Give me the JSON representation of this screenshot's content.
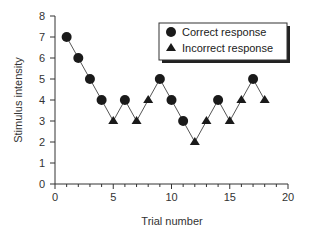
{
  "chart_data": {
    "type": "line",
    "title": "",
    "xlabel": "Trial number",
    "ylabel": "Stimulus intensity",
    "xlim": [
      0,
      20
    ],
    "ylim": [
      0,
      8
    ],
    "x_ticks": [
      0,
      5,
      10,
      15,
      20
    ],
    "x_minor_ticks_step": 1,
    "y_ticks": [
      0,
      1,
      2,
      3,
      4,
      5,
      6,
      7,
      8
    ],
    "grid": false,
    "legend_position": "upper right",
    "legend": [
      {
        "label": "Correct response",
        "marker": "circle"
      },
      {
        "label": "Incorrect response",
        "marker": "triangle"
      }
    ],
    "line_color": "#555555",
    "marker_color": "#1a1a1a",
    "points": [
      {
        "trial": 1,
        "intensity": 7,
        "response": "correct"
      },
      {
        "trial": 2,
        "intensity": 6,
        "response": "correct"
      },
      {
        "trial": 3,
        "intensity": 5,
        "response": "correct"
      },
      {
        "trial": 4,
        "intensity": 4,
        "response": "correct"
      },
      {
        "trial": 5,
        "intensity": 3,
        "response": "incorrect"
      },
      {
        "trial": 6,
        "intensity": 4,
        "response": "correct"
      },
      {
        "trial": 7,
        "intensity": 3,
        "response": "incorrect"
      },
      {
        "trial": 8,
        "intensity": 4,
        "response": "incorrect"
      },
      {
        "trial": 9,
        "intensity": 5,
        "response": "correct"
      },
      {
        "trial": 10,
        "intensity": 4,
        "response": "correct"
      },
      {
        "trial": 11,
        "intensity": 3,
        "response": "correct"
      },
      {
        "trial": 12,
        "intensity": 2,
        "response": "incorrect"
      },
      {
        "trial": 13,
        "intensity": 3,
        "response": "incorrect"
      },
      {
        "trial": 14,
        "intensity": 4,
        "response": "correct"
      },
      {
        "trial": 15,
        "intensity": 3,
        "response": "incorrect"
      },
      {
        "trial": 16,
        "intensity": 4,
        "response": "incorrect"
      },
      {
        "trial": 17,
        "intensity": 5,
        "response": "correct"
      },
      {
        "trial": 18,
        "intensity": 4,
        "response": "incorrect"
      }
    ]
  }
}
